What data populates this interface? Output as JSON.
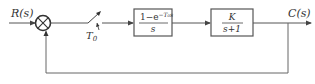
{
  "diagram": {
    "type": "sampled-data feedback control system block diagram",
    "input_label": "R(s)",
    "output_label": "C(s)",
    "summing_junction": {
      "symbol": "cross"
    },
    "sampler": {
      "label": "T",
      "subscript": "0"
    },
    "blocks": [
      {
        "id": "zoh",
        "numerator": "1−e",
        "numerator_exponent": "−T₀s",
        "denominator": "s"
      },
      {
        "id": "plant",
        "numerator": "K",
        "denominator": "s+1"
      }
    ],
    "feedback": "unity negative feedback from C(s) to summing junction",
    "colors": {
      "stroke": "#555555",
      "text": "#333333",
      "background": "#ffffff"
    }
  }
}
